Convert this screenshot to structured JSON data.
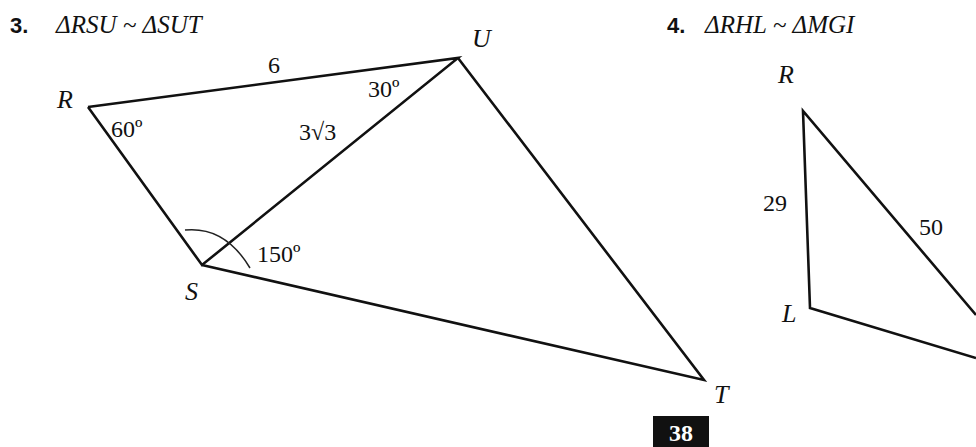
{
  "problems": [
    {
      "number": "3.",
      "statement": "ΔRSU ~ ΔSUT",
      "vertices": {
        "R": "R",
        "S": "S",
        "U": "U",
        "T": "T"
      },
      "side_labels": {
        "RU": "6",
        "SU": "3√3"
      },
      "angle_labels": {
        "R": "60º",
        "U": "30º",
        "S": "150º"
      }
    },
    {
      "number": "4.",
      "statement": "ΔRHL ~ ΔMGI",
      "vertices": {
        "R": "R",
        "L": "L"
      },
      "side_labels": {
        "RL": "29",
        "RH": "50"
      }
    }
  ],
  "page_number": "38"
}
